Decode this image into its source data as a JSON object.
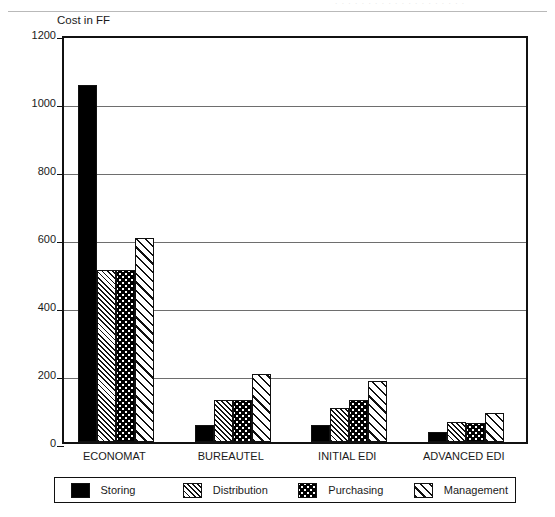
{
  "header": {
    "ghost_text": "· · · · · · · · · · · · · · · · · · · ·"
  },
  "chart_data": {
    "type": "bar",
    "title": "",
    "subtitle": "",
    "xlabel": "",
    "ylabel": "Cost in FF",
    "ylim": [
      0,
      1200
    ],
    "ytick_step": 200,
    "yticks": [
      0,
      200,
      400,
      600,
      800,
      1000,
      1200
    ],
    "ytick_labels": [
      "0",
      "200",
      "400",
      "600",
      "800",
      "1000",
      "1200"
    ],
    "grid": true,
    "grid_axis": "y",
    "legend_position": "bottom",
    "categories": [
      "ECONOMAT",
      "BUREAUTEL",
      "INITIAL EDI",
      "ADVANCED EDI"
    ],
    "series": [
      {
        "name": "Storing",
        "pattern": "solid",
        "values": [
          1050,
          50,
          50,
          30
        ]
      },
      {
        "name": "Distribution",
        "pattern": "fine-hatch",
        "values": [
          505,
          125,
          100,
          60
        ]
      },
      {
        "name": "Purchasing",
        "pattern": "dots",
        "values": [
          505,
          125,
          125,
          55
        ]
      },
      {
        "name": "Management",
        "pattern": "wide-hatch",
        "values": [
          600,
          200,
          180,
          85
        ]
      }
    ]
  },
  "legend": {
    "items": [
      {
        "label": "Storing",
        "pattern": "solid"
      },
      {
        "label": "Distribution",
        "pattern": "fine-hatch"
      },
      {
        "label": "Purchasing",
        "pattern": "dots"
      },
      {
        "label": "Management",
        "pattern": "wide-hatch"
      }
    ]
  }
}
